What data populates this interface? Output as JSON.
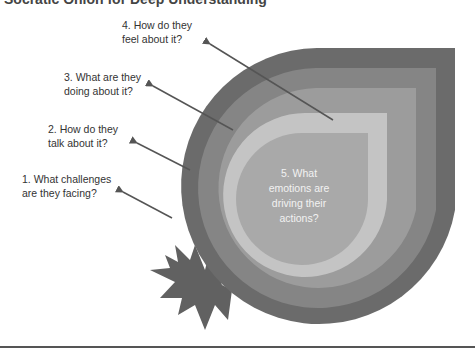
{
  "title": "Socratic Onion for Deep Understanding",
  "layers": [
    {
      "level": 1,
      "label": "1. What challenges are they facing?",
      "line1": "1. What challenges",
      "line2": "are they facing?",
      "color": "#6b6b6b"
    },
    {
      "level": 2,
      "label": "2. How do they talk about it?",
      "line1": "2. How do they",
      "line2": "talk about it?",
      "color": "#858585"
    },
    {
      "level": 3,
      "label": "3. What are they doing about it?",
      "line1": "3. What are they",
      "line2": "doing about it?",
      "color": "#9c9c9c"
    },
    {
      "level": 4,
      "label": "4. How do they feel about it?",
      "line1": "4. How do they",
      "line2": "feel about it?",
      "color": "#c4c4c4"
    },
    {
      "level": 5,
      "label": "5. What emotions are driving their actions?",
      "lines": [
        "5. What",
        "emotions are",
        "driving their",
        "actions?"
      ],
      "color": "#a9a9a9"
    }
  ],
  "colors": {
    "starburst": "#616161",
    "arrow": "#555555",
    "text": "#333333",
    "center_text": "#f2f2f2"
  }
}
